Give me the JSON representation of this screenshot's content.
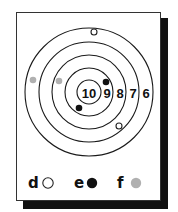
{
  "target": {
    "center": [
      89,
      92
    ],
    "rings": [
      {
        "score": "10",
        "radius": 12
      },
      {
        "score": "9",
        "radius": 24
      },
      {
        "score": "8",
        "radius": 37
      },
      {
        "score": "7",
        "radius": 50
      },
      {
        "score": "6",
        "radius": 64
      }
    ],
    "score_labels": [
      {
        "text": "10",
        "x": 89,
        "y": 93
      },
      {
        "text": "9",
        "x": 107,
        "y": 93
      },
      {
        "text": "8",
        "x": 120,
        "y": 93
      },
      {
        "text": "7",
        "x": 133,
        "y": 93
      },
      {
        "text": "6",
        "x": 146,
        "y": 93
      }
    ],
    "hits": [
      {
        "type": "d",
        "x": 94,
        "y": 32
      },
      {
        "type": "d",
        "x": 119,
        "y": 126
      },
      {
        "type": "e",
        "x": 106,
        "y": 82
      },
      {
        "type": "e",
        "x": 79,
        "y": 108
      },
      {
        "type": "f",
        "x": 33,
        "y": 80
      },
      {
        "type": "f",
        "x": 59,
        "y": 81
      }
    ]
  },
  "legend": [
    {
      "letter": "d",
      "marker": "open-circle",
      "letter_x": 28,
      "marker_x": 48,
      "y": 183
    },
    {
      "letter": "e",
      "marker": "black-dot",
      "letter_x": 74,
      "marker_x": 92,
      "y": 183
    },
    {
      "letter": "f",
      "marker": "gray-dot",
      "letter_x": 117,
      "marker_x": 136,
      "y": 183
    }
  ],
  "colors": {
    "ring": "#1a1a1a",
    "open_circle_stroke": "#222222",
    "black_dot": "#111111",
    "gray_dot": "#b0b0b0",
    "shadow": "#111111",
    "card": "#ffffff"
  }
}
